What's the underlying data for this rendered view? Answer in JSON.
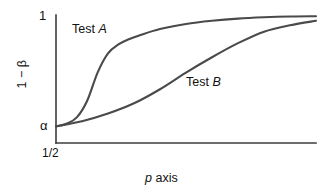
{
  "chart_data": {
    "type": "line",
    "title": "",
    "subtitle": "",
    "xlabel": "p axis",
    "ylabel": "1 − β",
    "xticks": [
      "1/2"
    ],
    "yticks": [
      "α",
      "1"
    ],
    "xlim": [
      0.5,
      1.0
    ],
    "ylim": [
      0,
      1
    ],
    "grid": false,
    "legend_position": "inline-annotations",
    "series": [
      {
        "name": "Test A",
        "label": "Test A",
        "color": "#4a4a4a",
        "x": [
          0.5,
          0.52,
          0.54,
          0.56,
          0.58,
          0.6,
          0.62,
          0.64,
          0.66,
          0.7,
          0.75,
          0.8,
          0.85,
          0.9,
          0.95,
          1.0
        ],
        "y": [
          0.13,
          0.15,
          0.2,
          0.33,
          0.55,
          0.7,
          0.77,
          0.81,
          0.84,
          0.89,
          0.93,
          0.955,
          0.972,
          0.982,
          0.988,
          0.99
        ]
      },
      {
        "name": "Test B",
        "label": "Test B",
        "color": "#4a4a4a",
        "x": [
          0.5,
          0.55,
          0.6,
          0.65,
          0.7,
          0.75,
          0.8,
          0.85,
          0.9,
          0.95,
          1.0
        ],
        "y": [
          0.13,
          0.17,
          0.23,
          0.31,
          0.42,
          0.55,
          0.67,
          0.78,
          0.87,
          0.92,
          0.955
        ]
      }
    ],
    "annotations": [
      {
        "text": "Test A",
        "x": 0.56,
        "y": 0.92
      },
      {
        "text": "Test B",
        "x": 0.77,
        "y": 0.52
      }
    ]
  },
  "axes": {
    "y_top_tick": "1",
    "y_alpha_tick": "α",
    "x_origin_tick": "1/2",
    "y_axis_title_prefix": "1 − ",
    "y_axis_title_symbol": "β",
    "x_axis_title_symbol": "p",
    "x_axis_title_rest": " axis",
    "axis_color": "#3d3d3d",
    "line_color": "#4a4a4a"
  },
  "series_labels": {
    "a_prefix": "Test ",
    "a_symbol": "A",
    "b_prefix": "Test ",
    "b_symbol": "B"
  }
}
